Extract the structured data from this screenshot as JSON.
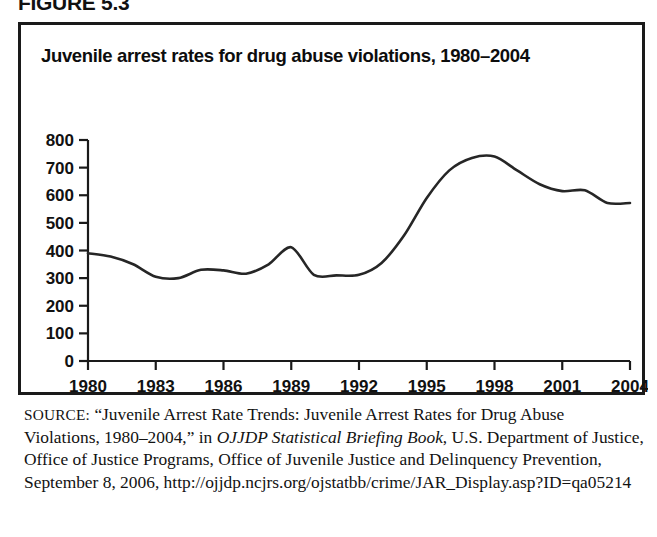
{
  "figure": {
    "label": "FIGURE 5.3",
    "title": "Juvenile arrest rates for drug abuse violations, 1980–2004"
  },
  "source": {
    "keyword": "SOURCE:",
    "line1": "“Juvenile Arrest Rate Trends: Juvenile Arrest Rates for Drug",
    "line2_a": "Abuse Violations, 1980–2004,” in ",
    "line2_italic": "OJJDP Statistical Briefing Book",
    "line2_b": ",",
    "line3": "U.S. Department of Justice, Office of Justice Programs, Office of",
    "line4": "Juvenile Justice and Delinquency Prevention, September 8, 2006,",
    "line5": "http://ojjdp.ncjrs.org/ojstatbb/crime/JAR_Display.asp?ID=qa05214"
  },
  "chart_data": {
    "type": "line",
    "title": "Juvenile arrest rates for drug abuse violations, 1980–2004",
    "xlabel": "",
    "ylabel": "",
    "xlim": [
      1980,
      2004
    ],
    "ylim": [
      0,
      800
    ],
    "grid": false,
    "legend": "none",
    "series_color": "#262626",
    "ytick_labels": [
      "800",
      "700",
      "600",
      "500",
      "400",
      "300",
      "200",
      "100",
      "0"
    ],
    "ytick_values": [
      800,
      700,
      600,
      500,
      400,
      300,
      200,
      100,
      0
    ],
    "xtick_labels": [
      "1980",
      "1983",
      "1986",
      "1989",
      "1992",
      "1995",
      "1998",
      "2001",
      "2004"
    ],
    "xtick_values": [
      1980,
      1983,
      1986,
      1989,
      1992,
      1995,
      1998,
      2001,
      2004
    ],
    "x": [
      1980,
      1981,
      1982,
      1983,
      1984,
      1985,
      1986,
      1987,
      1988,
      1989,
      1990,
      1991,
      1992,
      1993,
      1994,
      1995,
      1996,
      1997,
      1998,
      1999,
      2000,
      2001,
      2002,
      2003,
      2004
    ],
    "values": [
      390,
      378,
      350,
      305,
      300,
      330,
      328,
      316,
      350,
      412,
      312,
      310,
      312,
      355,
      455,
      590,
      690,
      735,
      740,
      690,
      640,
      615,
      618,
      572,
      572
    ],
    "series": [
      {
        "name": "Juvenile arrest rate for drug abuse violations",
        "values": [
          390,
          378,
          350,
          305,
          300,
          330,
          328,
          316,
          350,
          412,
          312,
          310,
          312,
          355,
          455,
          590,
          690,
          735,
          740,
          690,
          640,
          615,
          618,
          572,
          572
        ]
      }
    ]
  }
}
